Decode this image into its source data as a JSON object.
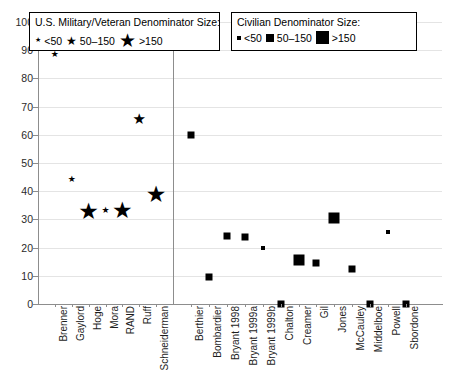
{
  "legends": {
    "military": {
      "title": "U.S. Military/Veteran Denominator Size:",
      "items": [
        {
          "label": "<50",
          "glyph": "star-small",
          "size": 7
        },
        {
          "label": "50–150",
          "glyph": "star-medium",
          "size": 12
        },
        {
          "label": ">150",
          "glyph": "star-large",
          "size": 19
        }
      ]
    },
    "civilian": {
      "title": "Civilian Denominator Size:",
      "items": [
        {
          "label": "<50",
          "glyph": "square-small",
          "size": 4
        },
        {
          "label": "50–150",
          "glyph": "square-medium",
          "size": 8
        },
        {
          "label": ">150",
          "glyph": "square-large",
          "size": 13
        }
      ]
    }
  },
  "chart_data": {
    "type": "scatter",
    "title": "",
    "xlabel": "",
    "ylabel": "",
    "ylim": [
      0,
      100
    ],
    "yticks": [
      0,
      10,
      20,
      30,
      40,
      50,
      60,
      70,
      80,
      90,
      100
    ],
    "grid": true,
    "legend_position": "top",
    "groups": [
      {
        "name": "U.S. Military/Veteran",
        "marker": "star",
        "points": [
          {
            "label": "Brenner",
            "value": 88.5,
            "size_class": "<50"
          },
          {
            "label": "Gaylord",
            "value": 44.5,
            "size_class": "<50"
          },
          {
            "label": "Hoge",
            "value": 33.0,
            "size_class": ">150"
          },
          {
            "label": "Mora",
            "value": 33.5,
            "size_class": "<50"
          },
          {
            "label": "RAND",
            "value": 33.5,
            "size_class": ">150"
          },
          {
            "label": "Ruff",
            "value": 65.5,
            "size_class": "50–150"
          },
          {
            "label": "Schneiderman",
            "value": 39.0,
            "size_class": ">150"
          }
        ]
      },
      {
        "name": "Civilian",
        "marker": "square",
        "points": [
          {
            "label": "Berthier",
            "value": 60.0,
            "size_class": "50–150"
          },
          {
            "label": "Bombardier",
            "value": 9.7,
            "size_class": "50–150"
          },
          {
            "label": "Bryant 1998",
            "value": 24.0,
            "size_class": "50–150"
          },
          {
            "label": "Bryant 1999a",
            "value": 23.8,
            "size_class": "50–150"
          },
          {
            "label": "Bryant 1999b",
            "value": 20.0,
            "size_class": "<50"
          },
          {
            "label": "Chalton",
            "value": 0.0,
            "size_class": "50–150"
          },
          {
            "label": "Creamer",
            "value": 15.5,
            "size_class": ">150"
          },
          {
            "label": "Gil",
            "value": 14.5,
            "size_class": "50–150"
          },
          {
            "label": "Jones",
            "value": 30.5,
            "size_class": ">150"
          },
          {
            "label": "McCauley",
            "value": 12.5,
            "size_class": "50–150"
          },
          {
            "label": "Middelboe",
            "value": 0.0,
            "size_class": "50–150"
          },
          {
            "label": "Powell",
            "value": 25.5,
            "size_class": "<50"
          },
          {
            "label": "Sbordone",
            "value": 0.0,
            "size_class": "50–150"
          }
        ]
      }
    ]
  }
}
